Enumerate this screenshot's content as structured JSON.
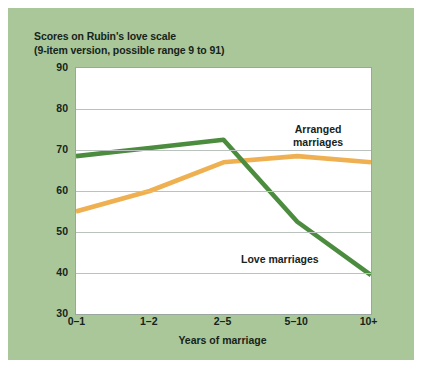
{
  "figure": {
    "background_color": "#aac79a",
    "plot_background_color": "#ffffff",
    "grid_color": "#b9c2bd"
  },
  "title": {
    "line1": "Scores on Rubin's love scale",
    "line2": "(9-item version, possible range 9 to 91)"
  },
  "annotations": {
    "arranged_line1": "Arranged",
    "arranged_line2": "marriages",
    "love": "Love marriages"
  },
  "chart_data": {
    "type": "line",
    "title": "Scores on Rubin's love scale (9-item version, possible range 9 to 91)",
    "xlabel": "Years of marriage",
    "ylabel": "",
    "categories": [
      "0–1",
      "1–2",
      "2–5",
      "5–10",
      "10+"
    ],
    "yticks": [
      30,
      40,
      50,
      60,
      70,
      80,
      90
    ],
    "ylim": [
      30,
      90
    ],
    "grid": true,
    "legend": "inline-annotations",
    "series": [
      {
        "name": "Arranged marriages",
        "color": "#eeb050",
        "values": [
          55,
          60,
          67,
          68.5,
          67
        ]
      },
      {
        "name": "Love marriages",
        "color": "#4c8c3f",
        "values": [
          68.5,
          70.5,
          72.5,
          52.5,
          39.5
        ]
      }
    ]
  }
}
